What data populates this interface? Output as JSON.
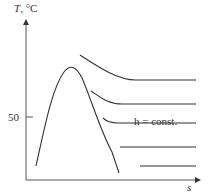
{
  "diagram": {
    "title": "",
    "y_axis": {
      "label_var": "T",
      "label_unit": ", °C",
      "tick": "50"
    },
    "x_axis": {
      "label": "s"
    },
    "annotation": "h = const.",
    "curve_count": 5,
    "colors": {
      "line": "#333333",
      "axis": "#555555"
    }
  }
}
